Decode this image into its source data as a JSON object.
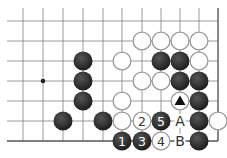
{
  "diagram": {
    "type": "go-board-fragment",
    "grid": {
      "cols_x": [
        23,
        43,
        63,
        83,
        103,
        122,
        142,
        161,
        180,
        199,
        218
      ],
      "rows_y": [
        21,
        41,
        61,
        81,
        101,
        121,
        141
      ],
      "left_extent": 7,
      "top_extent": 8,
      "right_edge_x": 218,
      "bottom_edge_y": 141,
      "line_color": "#808080",
      "edge_color": "#555555"
    },
    "star_points": [
      {
        "x": 43,
        "y": 81
      }
    ],
    "stones": [
      {
        "color": "white",
        "x": 142,
        "y": 41
      },
      {
        "color": "white",
        "x": 161,
        "y": 41
      },
      {
        "color": "white",
        "x": 180,
        "y": 41
      },
      {
        "color": "white",
        "x": 199,
        "y": 41
      },
      {
        "color": "black",
        "x": 83,
        "y": 61
      },
      {
        "color": "white",
        "x": 122,
        "y": 61
      },
      {
        "color": "black",
        "x": 161,
        "y": 61
      },
      {
        "color": "black",
        "x": 180,
        "y": 61
      },
      {
        "color": "white",
        "x": 199,
        "y": 61
      },
      {
        "color": "black",
        "x": 83,
        "y": 81
      },
      {
        "color": "white",
        "x": 142,
        "y": 81
      },
      {
        "color": "white",
        "x": 161,
        "y": 81
      },
      {
        "color": "black",
        "x": 180,
        "y": 81
      },
      {
        "color": "black",
        "x": 199,
        "y": 81
      },
      {
        "color": "black",
        "x": 83,
        "y": 101
      },
      {
        "color": "white",
        "x": 122,
        "y": 101
      },
      {
        "color": "white",
        "x": 180,
        "y": 101,
        "mark": "triangle"
      },
      {
        "color": "black",
        "x": 199,
        "y": 101
      },
      {
        "color": "black",
        "x": 63,
        "y": 121
      },
      {
        "color": "black",
        "x": 103,
        "y": 121
      },
      {
        "color": "white",
        "x": 122,
        "y": 121
      },
      {
        "color": "white",
        "x": 142,
        "y": 121,
        "label": "2"
      },
      {
        "color": "black",
        "x": 161,
        "y": 121,
        "label": "5"
      },
      {
        "color": "black",
        "x": 199,
        "y": 121
      },
      {
        "color": "white",
        "x": 218,
        "y": 121
      },
      {
        "color": "black",
        "x": 122,
        "y": 141,
        "label": "1"
      },
      {
        "color": "black",
        "x": 142,
        "y": 141,
        "label": "3"
      },
      {
        "color": "white",
        "x": 161,
        "y": 141,
        "label": "4"
      },
      {
        "color": "black",
        "x": 199,
        "y": 141
      }
    ],
    "point_labels": [
      {
        "text": "A",
        "x": 180,
        "y": 121
      },
      {
        "text": "B",
        "x": 180,
        "y": 141
      }
    ],
    "colors": {
      "black_stone": "#2b2b2b",
      "white_stone": "#ffffff",
      "white_outline": "#9a9a9a",
      "black_label": "#ffffff",
      "white_label": "#333333",
      "point_label": "#333333"
    },
    "stone_radius": 9.5
  }
}
